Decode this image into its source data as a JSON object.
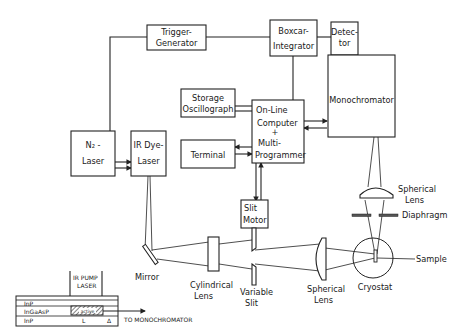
{
  "diagram": {
    "blocks": {
      "trigger_generator": [
        "Trigger-",
        "Generator"
      ],
      "boxcar_integrator": [
        "Boxcar-",
        "Integrator"
      ],
      "detector": [
        "Detec-",
        "tor"
      ],
      "storage_oscilloscope": [
        "Storage",
        "Oscillograph"
      ],
      "online_computer": [
        "On-Line",
        "Computer",
        "+",
        "Multi-",
        "Programmer"
      ],
      "monochromator": "Monochromator",
      "terminal": "Terminal",
      "n2_laser": [
        "N₂ -",
        "Laser"
      ],
      "ir_dye_laser": [
        "IR Dye-",
        "Laser"
      ],
      "slit_motor": [
        "Slit",
        "Motor"
      ]
    },
    "optics": {
      "mirror": "Mirror",
      "cylindrical_lens": [
        "Cylindrical",
        "Lens"
      ],
      "variable_slit": [
        "Variable",
        "Slit"
      ],
      "spherical_lens_horizontal": [
        "Spherical",
        "Lens"
      ],
      "spherical_lens_vertical": [
        "Spherical",
        "Lens"
      ],
      "diaphragm": "Diaphragm",
      "sample": "Sample",
      "cryostat": "Cryostat"
    },
    "inset": {
      "pump_label": [
        "IR PUMP",
        "LASER"
      ],
      "layers": [
        "InP",
        "InGaAsP",
        "InP"
      ],
      "active_label": "active",
      "length_label": "L",
      "delta_label": "Δ",
      "output_label": "TO MONOCHROMATOR"
    }
  }
}
